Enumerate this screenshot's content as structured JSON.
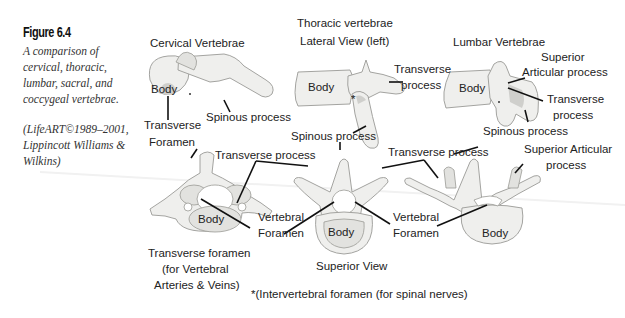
{
  "figure": {
    "number": "Figure 6.4",
    "caption": "A comparison of cervical, thoracic, lumbar, sacral, and coccygeal vertebrae.",
    "credit": "(LifeART©1989–2001, Lippincott Williams & Wilkins)"
  },
  "headings": {
    "cervical": "Cervical Vertebrae",
    "thoracic_line1": "Thoracic vertebrae",
    "thoracic_line2": "Lateral View (left)",
    "lumbar": "Lumbar Vertebrae"
  },
  "labels": {
    "body": "Body",
    "transverse": "Transverse",
    "foramen": "Foramen",
    "spinous_process": "Spinous process",
    "transverse_process": "Transverse process",
    "process": "process",
    "superior": "Superior",
    "articular_process": "Articular process",
    "superior_articular": "Superior Articular",
    "vertebral": "Vertebral",
    "transverse_foramen_1": "Transverse foramen",
    "transverse_foramen_2": "(for Vertebral",
    "transverse_foramen_3": "Arteries & Veins)",
    "superior_view": "Superior View",
    "asterisk": "*",
    "footnote": "*(Intervertebral foramen (for spinal nerves)"
  },
  "colors": {
    "bone": "#efefed",
    "bone_outline": "#9a9a96",
    "leader_line": "#111111",
    "text": "#222222"
  }
}
